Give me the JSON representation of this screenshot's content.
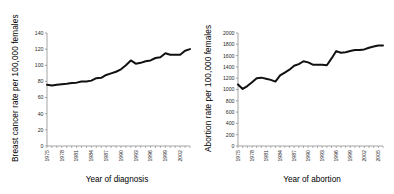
{
  "figure": {
    "background_color": "#ffffff",
    "line_color": "#111111",
    "axis_color": "#808080",
    "tick_text_color": "#2a2a2a"
  },
  "panels": [
    {
      "id": "breast-cancer-panel",
      "ylabel": "Breast cancer rate per 100,000 females",
      "xlabel": "Year of diagnosis"
    },
    {
      "id": "abortion-panel",
      "ylabel": "Abortion rate per 100,000 females",
      "xlabel": "Year of abortion"
    }
  ],
  "chart_data": [
    {
      "type": "line",
      "title": "",
      "xlabel": "Year of diagnosis",
      "ylabel": "Breast cancer rate per 100,000 females",
      "xlim": [
        1975,
        2004
      ],
      "ylim": [
        0,
        140
      ],
      "yticks": [
        0,
        20,
        40,
        60,
        80,
        100,
        120,
        140
      ],
      "xticks": [
        1975,
        1978,
        1981,
        1984,
        1987,
        1990,
        1993,
        1996,
        1999,
        2002
      ],
      "xtick_labels": [
        "1975",
        "1978",
        "1981",
        "1984",
        "1987",
        "1990",
        "1993",
        "1996",
        "1999",
        "2002"
      ],
      "ytick_labels": [
        "0",
        "20",
        "40",
        "60",
        "80",
        "100",
        "120",
        "140"
      ],
      "grid": false,
      "legend": "none",
      "x": [
        1975,
        1976,
        1977,
        1978,
        1979,
        1980,
        1981,
        1982,
        1983,
        1984,
        1985,
        1986,
        1987,
        1988,
        1989,
        1990,
        1991,
        1992,
        1993,
        1994,
        1995,
        1996,
        1997,
        1998,
        1999,
        2000,
        2001,
        2002,
        2003,
        2004
      ],
      "values": [
        76,
        75,
        76,
        76.5,
        77,
        78,
        78.5,
        80,
        80,
        81,
        84,
        84.5,
        88,
        90,
        92,
        95,
        100,
        106,
        102,
        103,
        105,
        106,
        109,
        110,
        115,
        113,
        113,
        113,
        118,
        120
      ]
    },
    {
      "type": "line",
      "title": "",
      "xlabel": "Year of abortion",
      "ylabel": "Abortion rate per 100,000 females",
      "xlim": [
        1975,
        2006
      ],
      "ylim": [
        0,
        2000
      ],
      "yticks": [
        0,
        200,
        400,
        600,
        800,
        1000,
        1200,
        1400,
        1600,
        1800,
        2000
      ],
      "xticks": [
        1975,
        1978,
        1981,
        1984,
        1987,
        1990,
        1993,
        1996,
        1999,
        2002,
        2005
      ],
      "xtick_labels": [
        "1975",
        "1978",
        "1981",
        "1984",
        "1987",
        "1990",
        "1993",
        "1996",
        "1999",
        "2002",
        "2005"
      ],
      "ytick_labels": [
        "0",
        "200",
        "400",
        "600",
        "800",
        "1000",
        "1200",
        "1400",
        "1600",
        "1800",
        "2000"
      ],
      "grid": false,
      "legend": "none",
      "x": [
        1975,
        1976,
        1977,
        1978,
        1979,
        1980,
        1981,
        1982,
        1983,
        1984,
        1985,
        1986,
        1987,
        1988,
        1989,
        1990,
        1991,
        1992,
        1993,
        1994,
        1995,
        1996,
        1997,
        1998,
        1999,
        2000,
        2001,
        2002,
        2003,
        2004,
        2005,
        2006
      ],
      "values": [
        1090,
        1010,
        1060,
        1130,
        1200,
        1210,
        1190,
        1170,
        1140,
        1250,
        1300,
        1350,
        1420,
        1450,
        1500,
        1480,
        1440,
        1440,
        1440,
        1430,
        1550,
        1680,
        1650,
        1660,
        1680,
        1700,
        1700,
        1710,
        1740,
        1760,
        1780,
        1780
      ]
    }
  ]
}
